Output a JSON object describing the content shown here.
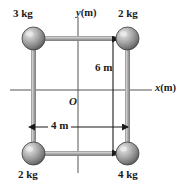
{
  "figure": {
    "background_color": "#ffffff",
    "ink_color": "#1a1a1a",
    "rod_color": "#9a9a9a",
    "axis_color": "#555555"
  },
  "axes": {
    "x_label": "x",
    "x_unit": "(m)",
    "y_label": "y",
    "y_unit": "(m)",
    "origin_label": "O"
  },
  "masses": [
    {
      "id": "top-left",
      "label": "3 kg",
      "value": 3,
      "unit": "kg",
      "x_m": -2,
      "y_m": 3
    },
    {
      "id": "top-right",
      "label": "2 kg",
      "value": 2,
      "unit": "kg",
      "x_m": 2,
      "y_m": 3
    },
    {
      "id": "bottom-left",
      "label": "2 kg",
      "value": 2,
      "unit": "kg",
      "x_m": -2,
      "y_m": -3
    },
    {
      "id": "bottom-right",
      "label": "4 kg",
      "value": 4,
      "unit": "kg",
      "x_m": 2,
      "y_m": -3
    }
  ],
  "dimensions": [
    {
      "id": "height",
      "label": "6 m",
      "value": 6,
      "unit": "m",
      "orientation": "vertical"
    },
    {
      "id": "width",
      "label": "4 m",
      "value": 4,
      "unit": "m",
      "orientation": "horizontal"
    }
  ]
}
